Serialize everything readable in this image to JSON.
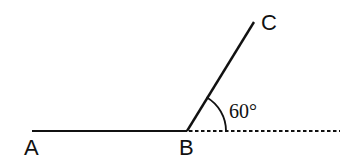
{
  "diagram": {
    "type": "geometry-angle",
    "colors": {
      "stroke": "#111111",
      "background": "#ffffff"
    },
    "points": {
      "A": {
        "label": "A",
        "x": 32,
        "y": 131
      },
      "B": {
        "label": "B",
        "x": 187,
        "y": 131
      },
      "C": {
        "label": "C",
        "x": 254,
        "y": 22
      }
    },
    "segments": [
      {
        "from": "A",
        "to": "B",
        "style": "solid"
      },
      {
        "from": "B",
        "to": "C",
        "style": "solid"
      },
      {
        "from": "B",
        "to_x": 340,
        "style": "dotted",
        "description": "extension of AB beyond B"
      }
    ],
    "angle": {
      "vertex": "B",
      "label": "60°",
      "degrees": 60,
      "between": [
        "BC",
        "extension of AB"
      ]
    },
    "labels": {
      "A": "A",
      "B": "B",
      "C": "C",
      "angle": "60°"
    }
  }
}
